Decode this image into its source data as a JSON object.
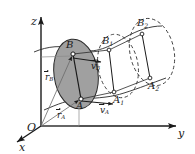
{
  "figure": {
    "background": "#ffffff",
    "ink": "#1a1a1a",
    "body_fill": "#a0a0a0",
    "dashed_stroke": "#3a3a3a"
  },
  "axes": {
    "z": {
      "label": "z"
    },
    "y": {
      "label": "y"
    },
    "x": {
      "label": "x"
    },
    "origin": {
      "label": "O"
    }
  },
  "points": {
    "B": {
      "label": "B",
      "sub": ""
    },
    "A": {
      "label": "A",
      "sub": ""
    },
    "B1": {
      "label": "B",
      "sub": "1"
    },
    "A1": {
      "label": "A",
      "sub": "1"
    },
    "B2": {
      "label": "B",
      "sub": "2"
    },
    "A2": {
      "label": "A",
      "sub": "2"
    }
  },
  "vectors": {
    "r_B": {
      "label": "r",
      "sub": "B"
    },
    "r_A": {
      "label": "r",
      "sub": "A"
    },
    "v_B": {
      "label": "v",
      "sub": "B"
    },
    "v_A": {
      "label": "v",
      "sub": "A"
    }
  }
}
